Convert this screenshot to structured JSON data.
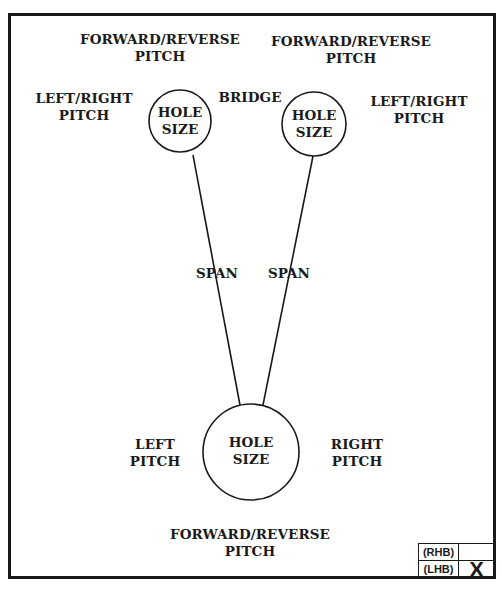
{
  "diagram": {
    "type": "pitch-layout-diagram",
    "colors": {
      "ink": "#1a1a1a",
      "background": "#ffffff"
    },
    "holes": [
      {
        "id": "upper-left",
        "label": [
          "HOLE",
          "SIZE"
        ],
        "cx": 180,
        "cy": 121,
        "r": 31
      },
      {
        "id": "upper-right",
        "label": [
          "HOLE",
          "SIZE"
        ],
        "cx": 314,
        "cy": 124,
        "r": 32
      },
      {
        "id": "bottom",
        "label": [
          "HOLE",
          "SIZE"
        ],
        "cx": 251,
        "cy": 452,
        "r": 48
      }
    ],
    "spans": [
      {
        "from": [
          193,
          155
        ],
        "to": [
          240,
          405
        ],
        "label": "SPAN"
      },
      {
        "from": [
          313,
          156
        ],
        "to": [
          263,
          405
        ],
        "label": "SPAN"
      }
    ],
    "labels": {
      "top_left_pitch": [
        "FORWARD/REVERSE",
        "PITCH"
      ],
      "top_right_pitch": [
        "FORWARD/REVERSE",
        "PITCH"
      ],
      "left_right_pitch_left": [
        "LEFT/RIGHT",
        "PITCH"
      ],
      "left_right_pitch_right": [
        "LEFT/RIGHT",
        "PITCH"
      ],
      "bridge": "BRIDGE",
      "span_left": "SPAN",
      "span_right": "SPAN",
      "left_pitch": [
        "LEFT",
        "PITCH"
      ],
      "right_pitch": [
        "RIGHT",
        "PITCH"
      ],
      "bottom_pitch": [
        "FORWARD/REVERSE",
        "PITCH"
      ]
    },
    "hand_box": {
      "rows": [
        {
          "label": "(RHB)",
          "mark": ""
        },
        {
          "label": "(LHB)",
          "mark": "X"
        }
      ]
    }
  }
}
